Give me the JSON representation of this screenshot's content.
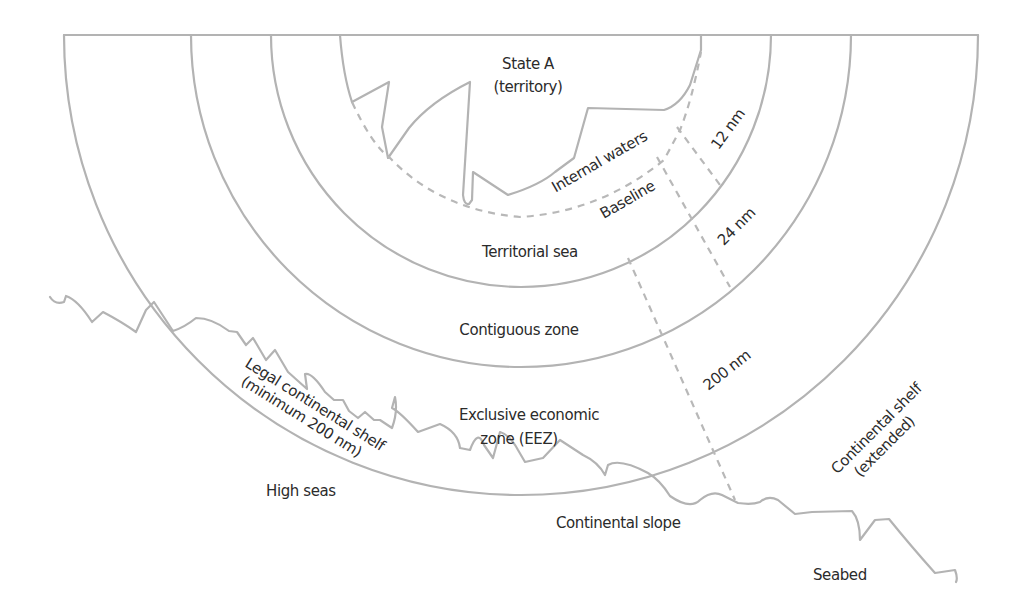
{
  "diagram": {
    "colors": {
      "line": "#b3b3b3",
      "text": "#2b2b2b",
      "background": "#ffffff"
    },
    "labels": {
      "state_line1": "State A",
      "state_line2": "(territory)",
      "internal_waters": "Internal waters",
      "baseline": "Baseline",
      "territorial_sea": "Territorial sea",
      "contiguous_zone": "Contiguous zone",
      "eez_line1": "Exclusive economic",
      "eez_line2": "zone (EEZ)",
      "legal_shelf_line1": "Legal continental shelf",
      "legal_shelf_line2": "(minimum 200 nm)",
      "high_seas": "High seas",
      "continental_slope": "Continental slope",
      "seabed": "Seabed",
      "extended_shelf_line1": "Continental shelf",
      "extended_shelf_line2": "(extended)"
    },
    "distances": {
      "d12": "12 nm",
      "d24": "24 nm",
      "d200": "200 nm"
    },
    "zones": [
      {
        "name": "Internal waters",
        "limit": "Baseline"
      },
      {
        "name": "Territorial sea",
        "limit": "12 nm"
      },
      {
        "name": "Contiguous zone",
        "limit": "24 nm"
      },
      {
        "name": "Exclusive economic zone (EEZ)",
        "limit": "200 nm"
      },
      {
        "name": "High seas",
        "limit": "beyond 200 nm"
      }
    ]
  }
}
